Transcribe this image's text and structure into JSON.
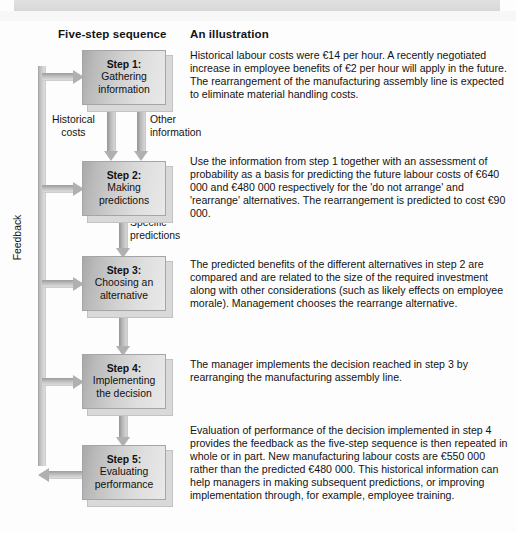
{
  "headings": {
    "left": "Five-step sequence",
    "right": "An illustration"
  },
  "feedback_label": "Feedback",
  "connectors": {
    "historical_costs": "Historical\ncosts",
    "historical_costs_line1": "Historical",
    "historical_costs_line2": "costs",
    "other_information_line1": "Other",
    "other_information_line2": "information",
    "specific_predictions_line1": "Specific",
    "specific_predictions_line2": "predictions"
  },
  "steps": [
    {
      "id": "step-1",
      "title": "Step 1:",
      "line1": "Gathering",
      "line2": "information"
    },
    {
      "id": "step-2",
      "title": "Step 2:",
      "line1": "Making",
      "line2": "predictions"
    },
    {
      "id": "step-3",
      "title": "Step 3:",
      "line1": "Choosing an",
      "line2": "alternative"
    },
    {
      "id": "step-4",
      "title": "Step 4:",
      "line1": "Implementing",
      "line2": "the decision"
    },
    {
      "id": "step-5",
      "title": "Step 5:",
      "line1": "Evaluating",
      "line2": "performance"
    }
  ],
  "illustrations": [
    {
      "id": "illustration-1",
      "text": "Historical labour costs were €14 per hour.  A recently negotiated increase in employee benefits of €2 per hour will apply in the future. The rearrangement of the manufacturing assembly line is expected to eliminate material handling costs."
    },
    {
      "id": "illustration-2",
      "text": "Use the information from step 1 together with an assessment of probability as a basis for predicting the future labour costs of €640 000 and €480 000 respectively for the 'do not arrange' and 'rearrange' alternatives. The rearrangement is predicted to cost €90 000."
    },
    {
      "id": "illustration-3",
      "text": "The predicted benefits of the different alternatives in step 2 are compared and are related to the size of the required investment along with other considerations (such as likely effects on employee morale). Management chooses the rearrange alternative."
    },
    {
      "id": "illustration-4",
      "text": "The manager implements the decision reached in step 3 by rearranging the manufacturing assembly line."
    },
    {
      "id": "illustration-5",
      "text": "Evaluation of performance of the decision implemented in step 4 provides the feedback as the five-step sequence is then repeated in whole or in part. New manufacturing labour costs are €550 000 rather than the predicted €480 000. This historical information can help managers in making subsequent predictions, or improving implementation through, for example, employee training."
    }
  ],
  "colors": {
    "box_fill_dark": "#a8a8a8",
    "box_fill_light": "#e9e9e9",
    "arrow_gray": "#b0b0b0",
    "text": "#131313",
    "page_background": "#ffffff"
  }
}
